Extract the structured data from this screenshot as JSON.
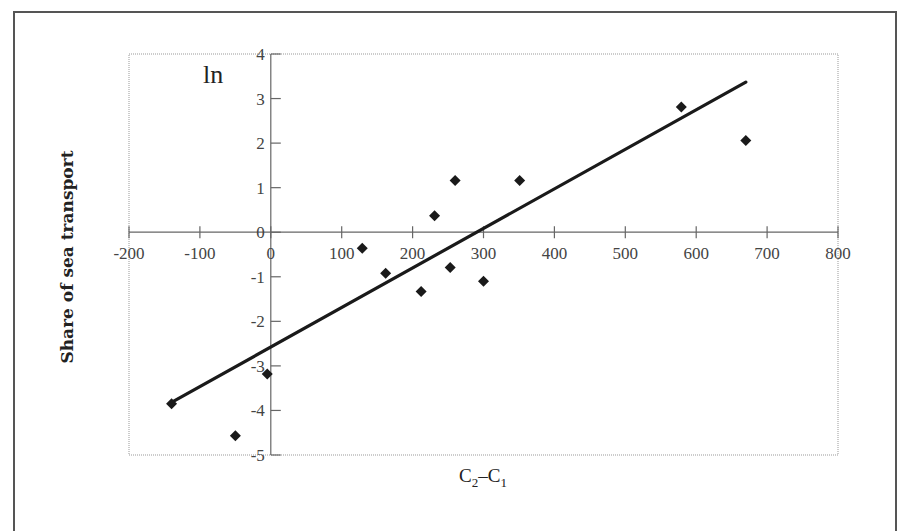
{
  "chart_data": {
    "type": "scatter",
    "title": "",
    "xlabel": "C2–C1",
    "xlabel_main": "C",
    "xlabel_sub1": "2",
    "xlabel_dash": "–C",
    "xlabel_sub2": "1",
    "ylabel": "Share of sea transport",
    "y_annotation": "ln",
    "xlim": [
      -200,
      800
    ],
    "ylim": [
      -5,
      4
    ],
    "x_ticks": [
      -200,
      -100,
      0,
      100,
      200,
      300,
      400,
      500,
      600,
      700,
      800
    ],
    "y_ticks": [
      -5,
      -4,
      -3,
      -2,
      -1,
      0,
      1,
      2,
      3,
      4
    ],
    "grid": false,
    "legend": null,
    "series": [
      {
        "name": "observations",
        "marker": "diamond",
        "color": "#1a1a1a",
        "points": [
          {
            "x": -140,
            "y": -3.85
          },
          {
            "x": -50,
            "y": -4.57
          },
          {
            "x": -5,
            "y": -3.18
          },
          {
            "x": 129,
            "y": -0.36
          },
          {
            "x": 162,
            "y": -0.92
          },
          {
            "x": 212,
            "y": -1.33
          },
          {
            "x": 231,
            "y": 0.37
          },
          {
            "x": 253,
            "y": -0.79
          },
          {
            "x": 260,
            "y": 1.16
          },
          {
            "x": 300,
            "y": -1.1
          },
          {
            "x": 351,
            "y": 1.16
          },
          {
            "x": 579,
            "y": 2.81
          },
          {
            "x": 670,
            "y": 2.06
          }
        ]
      },
      {
        "name": "linear fit",
        "type": "line",
        "color": "#1a1a1a",
        "points": [
          {
            "x": -140,
            "y": -3.82
          },
          {
            "x": 670,
            "y": 3.37
          }
        ]
      }
    ]
  },
  "header": {
    "cut_title": ""
  }
}
